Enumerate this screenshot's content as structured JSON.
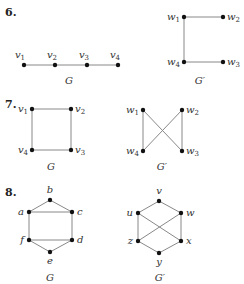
{
  "problems": [
    {
      "number": "6.",
      "graphs": [
        {
          "caption": "G",
          "nodes": [
            {
              "id": "v1",
              "base": "v",
              "sub": "1",
              "x": 24,
              "y": 65,
              "lx": 20,
              "ly": 58,
              "anchor": "middle"
            },
            {
              "id": "v2",
              "base": "v",
              "sub": "2",
              "x": 55,
              "y": 65,
              "lx": 52,
              "ly": 58,
              "anchor": "middle"
            },
            {
              "id": "v3",
              "base": "v",
              "sub": "3",
              "x": 87,
              "y": 65,
              "lx": 84,
              "ly": 58,
              "anchor": "middle"
            },
            {
              "id": "v4",
              "base": "v",
              "sub": "4",
              "x": 118,
              "y": 65,
              "lx": 115,
              "ly": 58,
              "anchor": "middle"
            }
          ],
          "edges": [
            [
              "v1",
              "v2"
            ],
            [
              "v2",
              "v3"
            ],
            [
              "v3",
              "v4"
            ]
          ],
          "caption_pos": {
            "x": 69,
            "y": 84
          }
        },
        {
          "caption": "G′",
          "nodes": [
            {
              "id": "w1",
              "base": "w",
              "sub": "1",
              "x": 184,
              "y": 17,
              "lx": 180,
              "ly": 20,
              "anchor": "end"
            },
            {
              "id": "w2",
              "base": "w",
              "sub": "2",
              "x": 223,
              "y": 17,
              "lx": 227,
              "ly": 20,
              "anchor": "start"
            },
            {
              "id": "w4",
              "base": "w",
              "sub": "4",
              "x": 184,
              "y": 62,
              "lx": 180,
              "ly": 65,
              "anchor": "end"
            },
            {
              "id": "w3",
              "base": "w",
              "sub": "3",
              "x": 223,
              "y": 62,
              "lx": 227,
              "ly": 65,
              "anchor": "start"
            }
          ],
          "edges": [
            [
              "w1",
              "w2"
            ],
            [
              "w1",
              "w4"
            ],
            [
              "w4",
              "w3"
            ]
          ],
          "caption_pos": {
            "x": 200,
            "y": 84
          }
        }
      ],
      "number_pos": {
        "x": 5,
        "y": 16
      }
    },
    {
      "number": "7.",
      "graphs": [
        {
          "caption": "G",
          "nodes": [
            {
              "id": "v1",
              "base": "v",
              "sub": "1",
              "x": 32,
              "y": 109,
              "lx": 28,
              "ly": 112,
              "anchor": "end"
            },
            {
              "id": "v2",
              "base": "v",
              "sub": "2",
              "x": 71,
              "y": 109,
              "lx": 75,
              "ly": 112,
              "anchor": "start"
            },
            {
              "id": "v4",
              "base": "v",
              "sub": "4",
              "x": 32,
              "y": 150,
              "lx": 28,
              "ly": 153,
              "anchor": "end"
            },
            {
              "id": "v3",
              "base": "v",
              "sub": "3",
              "x": 71,
              "y": 150,
              "lx": 75,
              "ly": 153,
              "anchor": "start"
            }
          ],
          "edges": [
            [
              "v1",
              "v2"
            ],
            [
              "v2",
              "v3"
            ],
            [
              "v3",
              "v4"
            ],
            [
              "v4",
              "v1"
            ]
          ],
          "caption_pos": {
            "x": 51,
            "y": 170
          }
        },
        {
          "caption": "G′",
          "nodes": [
            {
              "id": "w1",
              "base": "w",
              "sub": "1",
              "x": 143,
              "y": 110,
              "lx": 139,
              "ly": 113,
              "anchor": "end"
            },
            {
              "id": "w2",
              "base": "w",
              "sub": "2",
              "x": 182,
              "y": 110,
              "lx": 186,
              "ly": 113,
              "anchor": "start"
            },
            {
              "id": "w4",
              "base": "w",
              "sub": "4",
              "x": 143,
              "y": 151,
              "lx": 139,
              "ly": 154,
              "anchor": "end"
            },
            {
              "id": "w3",
              "base": "w",
              "sub": "3",
              "x": 182,
              "y": 151,
              "lx": 186,
              "ly": 154,
              "anchor": "start"
            }
          ],
          "edges": [
            [
              "w1",
              "w4"
            ],
            [
              "w2",
              "w3"
            ],
            [
              "w1",
              "w3"
            ],
            [
              "w2",
              "w4"
            ]
          ],
          "caption_pos": {
            "x": 162,
            "y": 170
          }
        }
      ],
      "number_pos": {
        "x": 5,
        "y": 108
      }
    },
    {
      "number": "8.",
      "graphs": [
        {
          "caption": "G",
          "nodes": [
            {
              "id": "b",
              "base": "b",
              "sub": "",
              "x": 50,
              "y": 200,
              "lx": 50,
              "ly": 193,
              "anchor": "middle"
            },
            {
              "id": "a",
              "base": "a",
              "sub": "",
              "x": 29,
              "y": 212,
              "lx": 24,
              "ly": 215,
              "anchor": "end"
            },
            {
              "id": "c",
              "base": "c",
              "sub": "",
              "x": 72,
              "y": 212,
              "lx": 77,
              "ly": 215,
              "anchor": "start"
            },
            {
              "id": "f",
              "base": "f",
              "sub": "",
              "x": 29,
              "y": 240,
              "lx": 24,
              "ly": 243,
              "anchor": "end"
            },
            {
              "id": "d",
              "base": "d",
              "sub": "",
              "x": 72,
              "y": 240,
              "lx": 77,
              "ly": 243,
              "anchor": "start"
            },
            {
              "id": "e",
              "base": "e",
              "sub": "",
              "x": 50,
              "y": 252,
              "lx": 50,
              "ly": 264,
              "anchor": "middle"
            }
          ],
          "edges": [
            [
              "a",
              "b"
            ],
            [
              "b",
              "c"
            ],
            [
              "a",
              "c"
            ],
            [
              "a",
              "f"
            ],
            [
              "c",
              "d"
            ],
            [
              "f",
              "d"
            ],
            [
              "f",
              "e"
            ],
            [
              "e",
              "d"
            ]
          ],
          "caption_pos": {
            "x": 50,
            "y": 281
          }
        },
        {
          "caption": "G′",
          "nodes": [
            {
              "id": "v",
              "base": "v",
              "sub": "",
              "x": 159,
              "y": 201,
              "lx": 159,
              "ly": 194,
              "anchor": "middle"
            },
            {
              "id": "u",
              "base": "u",
              "sub": "",
              "x": 138,
              "y": 213,
              "lx": 133,
              "ly": 216,
              "anchor": "end"
            },
            {
              "id": "w",
              "base": "w",
              "sub": "",
              "x": 181,
              "y": 213,
              "lx": 186,
              "ly": 216,
              "anchor": "start"
            },
            {
              "id": "z",
              "base": "z",
              "sub": "",
              "x": 138,
              "y": 241,
              "lx": 133,
              "ly": 244,
              "anchor": "end"
            },
            {
              "id": "x",
              "base": "x",
              "sub": "",
              "x": 181,
              "y": 241,
              "lx": 186,
              "ly": 244,
              "anchor": "start"
            },
            {
              "id": "y",
              "base": "y",
              "sub": "",
              "x": 159,
              "y": 253,
              "lx": 159,
              "ly": 265,
              "anchor": "middle"
            }
          ],
          "edges": [
            [
              "u",
              "v"
            ],
            [
              "v",
              "w"
            ],
            [
              "u",
              "z"
            ],
            [
              "w",
              "x"
            ],
            [
              "z",
              "y"
            ],
            [
              "y",
              "x"
            ],
            [
              "u",
              "x"
            ],
            [
              "w",
              "z"
            ]
          ],
          "caption_pos": {
            "x": 160,
            "y": 281
          }
        }
      ],
      "number_pos": {
        "x": 5,
        "y": 196
      }
    }
  ]
}
